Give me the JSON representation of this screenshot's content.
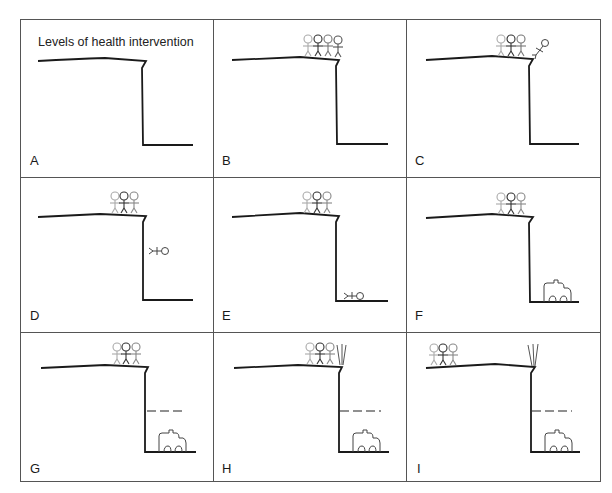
{
  "figure": {
    "title": "Levels of health intervention",
    "panels": [
      {
        "label": "A",
        "figures_on_cliff": 0,
        "falling_person": "none",
        "ambulance": false,
        "net": false,
        "fence": false
      },
      {
        "label": "B",
        "figures_on_cliff": 4,
        "falling_person": "none",
        "ambulance": false,
        "net": false,
        "fence": false
      },
      {
        "label": "C",
        "figures_on_cliff": 3,
        "falling_person": "at-edge",
        "ambulance": false,
        "net": false,
        "fence": false
      },
      {
        "label": "D",
        "figures_on_cliff": 3,
        "falling_person": "mid-fall",
        "ambulance": false,
        "net": false,
        "fence": false
      },
      {
        "label": "E",
        "figures_on_cliff": 3,
        "falling_person": "at-bottom",
        "ambulance": false,
        "net": false,
        "fence": false
      },
      {
        "label": "F",
        "figures_on_cliff": 3,
        "falling_person": "none",
        "ambulance": true,
        "net": false,
        "fence": false
      },
      {
        "label": "G",
        "figures_on_cliff": 3,
        "falling_person": "none",
        "ambulance": true,
        "net": true,
        "fence": false
      },
      {
        "label": "H",
        "figures_on_cliff": 3,
        "falling_person": "none",
        "ambulance": true,
        "net": true,
        "fence": true
      },
      {
        "label": "I",
        "figures_on_cliff": 3,
        "falling_person": "none",
        "ambulance": true,
        "net": true,
        "fence": true,
        "figures_moved_back": true
      }
    ]
  },
  "colors": {
    "line": "#1a1a1a",
    "border": "#555555",
    "figure_light": "#aaaaaa",
    "figure_mid": "#888888",
    "figure_dark": "#333333"
  }
}
